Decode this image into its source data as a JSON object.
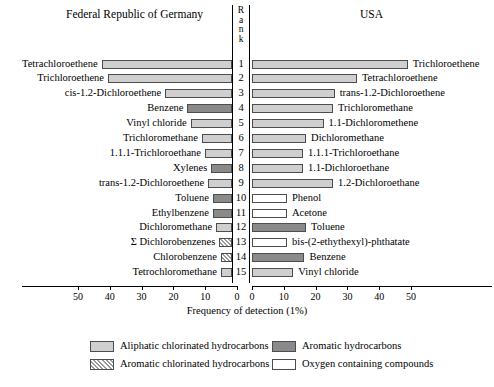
{
  "header": {
    "left_title": "Federal Republic of Germany",
    "right_title": "USA",
    "rank_title": "Rank"
  },
  "axis": {
    "xlabel": "Frequency of detection (1%)",
    "left_ticks": [
      "50",
      "40",
      "30",
      "20",
      "10",
      "0"
    ],
    "right_ticks": [
      "0",
      "10",
      "20",
      "30",
      "40",
      "50"
    ]
  },
  "legend": {
    "items": [
      {
        "label": "Aliphatic chlorinated hydrocarbons",
        "swatch": "aliph"
      },
      {
        "label": "Aromatic chlorinated hydrocarbons",
        "swatch": "aromchl"
      },
      {
        "label": "Aromatic hydrocarbons",
        "swatch": "arom"
      },
      {
        "label": "Oxygen containing compounds",
        "swatch": "oxy"
      }
    ]
  },
  "chart_data": {
    "type": "bar",
    "xlabel": "Frequency of detection (1%)",
    "ylabel": "Rank",
    "orientation": "horizontal-bidirectional",
    "xlim_left": [
      0,
      55
    ],
    "xlim_right": [
      0,
      55
    ],
    "grid": false,
    "ranks": [
      1,
      2,
      3,
      4,
      5,
      6,
      7,
      8,
      9,
      10,
      11,
      12,
      13,
      14,
      15
    ],
    "series": [
      {
        "name": "Federal Republic of Germany",
        "side": "left",
        "points": [
          {
            "rank": 1,
            "label": "Tetrachloroethene",
            "value": 41.0,
            "category": "aliph"
          },
          {
            "rank": 2,
            "label": "Trichloroethene",
            "value": 39.0,
            "category": "aliph"
          },
          {
            "rank": 3,
            "label": "cis-1.2-Dichloroethene",
            "value": 21.0,
            "category": "aliph"
          },
          {
            "rank": 4,
            "label": "Benzene",
            "value": 14.0,
            "category": "arom"
          },
          {
            "rank": 5,
            "label": "Vinyl chloride",
            "value": 13.0,
            "category": "aliph"
          },
          {
            "rank": 6,
            "label": "Trichloromethane",
            "value": 9.5,
            "category": "aliph"
          },
          {
            "rank": 7,
            "label": "1.1.1-Trichloroethane",
            "value": 8.5,
            "category": "aliph"
          },
          {
            "rank": 8,
            "label": "Xylenes",
            "value": 6.5,
            "category": "arom"
          },
          {
            "rank": 9,
            "label": "trans-1.2-Dichloroethene",
            "value": 7.5,
            "category": "aliph"
          },
          {
            "rank": 10,
            "label": "Toluene",
            "value": 6.0,
            "category": "arom"
          },
          {
            "rank": 11,
            "label": "Ethylbenzene",
            "value": 6.0,
            "category": "arom"
          },
          {
            "rank": 12,
            "label": "Dichloromethane",
            "value": 5.0,
            "category": "aliph"
          },
          {
            "rank": 13,
            "label": "Σ Dichlorobenzenes",
            "value": 4.0,
            "category": "aromchl"
          },
          {
            "rank": 14,
            "label": "Chlorobenzene",
            "value": 3.5,
            "category": "aromchl"
          },
          {
            "rank": 15,
            "label": "Tetrochloromethane",
            "value": 3.5,
            "category": "aliph"
          }
        ]
      },
      {
        "name": "USA",
        "side": "right",
        "points": [
          {
            "rank": 1,
            "label": "Trichloroethene",
            "value": 49.0,
            "category": "aliph"
          },
          {
            "rank": 2,
            "label": "Tetrachloroethene",
            "value": 33.0,
            "category": "aliph"
          },
          {
            "rank": 3,
            "label": "trans-1.2-Dichloroethene",
            "value": 26.0,
            "category": "aliph"
          },
          {
            "rank": 4,
            "label": "Trichloromethane",
            "value": 25.5,
            "category": "aliph"
          },
          {
            "rank": 5,
            "label": "1.1-Dichloromethene",
            "value": 22.5,
            "category": "aliph"
          },
          {
            "rank": 6,
            "label": "Dichloromethane",
            "value": 17.0,
            "category": "aliph"
          },
          {
            "rank": 7,
            "label": "1.1.1-Trichloroethane",
            "value": 16.0,
            "category": "aliph"
          },
          {
            "rank": 8,
            "label": "1.1-Dichloroethane",
            "value": 16.0,
            "category": "aliph"
          },
          {
            "rank": 9,
            "label": "1.2-Dichloroethane",
            "value": 25.5,
            "category": "aliph"
          },
          {
            "rank": 10,
            "label": "Phenol",
            "value": 11.0,
            "category": "oxy"
          },
          {
            "rank": 11,
            "label": "Acetone",
            "value": 11.0,
            "category": "oxy"
          },
          {
            "rank": 12,
            "label": "Toluene",
            "value": 17.0,
            "category": "arom"
          },
          {
            "rank": 13,
            "label": "bis-(2-ethythexyl)-phthatate",
            "value": 11.0,
            "category": "oxy"
          },
          {
            "rank": 14,
            "label": "Benzene",
            "value": 16.5,
            "category": "arom"
          },
          {
            "rank": 15,
            "label": "Vinyl chloride",
            "value": 13.0,
            "category": "aliph"
          }
        ]
      }
    ]
  }
}
